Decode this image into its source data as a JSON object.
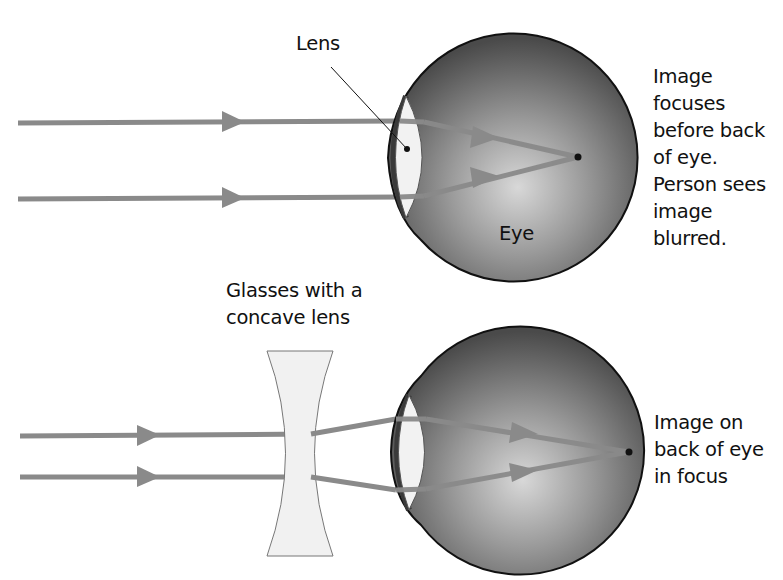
{
  "colors": {
    "ray": "#8a8a8a",
    "eye_dark": "#4a4a4a",
    "eye_light": "#d4d4d4",
    "eye_outline": "#111111",
    "lens_fill": "#f2f2f2",
    "text": "#111111"
  },
  "top_panel": {
    "lens_label": "Lens",
    "eye_label": "Eye",
    "caption_lines": [
      "Image",
      "focuses",
      "before back",
      "of eye.",
      "Person sees",
      "image",
      "blurred."
    ]
  },
  "bottom_panel": {
    "glasses_label_lines": [
      "Glasses with a",
      "concave lens"
    ],
    "caption_lines": [
      "Image on",
      "back of eye",
      "in focus"
    ]
  }
}
